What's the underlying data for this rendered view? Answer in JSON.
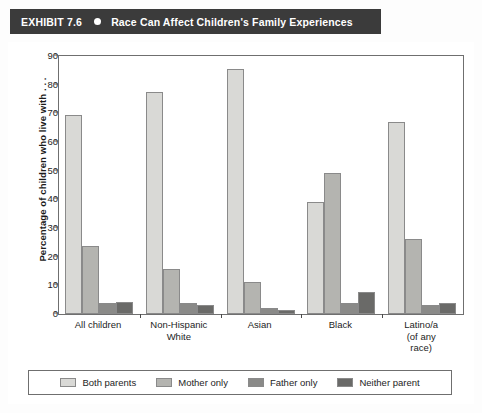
{
  "header": {
    "exhibit_label": "EXHIBIT 7.6",
    "bullet_icon": "bullet-dot",
    "title": "Race Can Affect Children's Family Experiences",
    "background_color": "#3b3b3b",
    "text_color": "#ffffff"
  },
  "chart_data": {
    "type": "bar",
    "title": "Race Can Affect Children's Family Experiences",
    "xlabel": "",
    "ylabel": "Percentage of children who live with . . .",
    "ylim": [
      0,
      90
    ],
    "yticks": [
      0,
      10,
      20,
      30,
      40,
      50,
      60,
      70,
      80,
      90
    ],
    "grid": false,
    "legend_position": "bottom",
    "categories": [
      "All children",
      "Non-Hispanic White",
      "Asian",
      "Black",
      "Latino/a (of any race)"
    ],
    "category_lines": [
      [
        "All children"
      ],
      [
        "Non-Hispanic",
        "White"
      ],
      [
        "Asian"
      ],
      [
        "Black"
      ],
      [
        "Latino/a",
        "(of any",
        "race)"
      ]
    ],
    "series": [
      {
        "name": "Both parents",
        "color": "#d9d9d6",
        "values": [
          69.3,
          77.5,
          85.5,
          39.0,
          67.0
        ]
      },
      {
        "name": "Mother only",
        "color": "#b4b4b0",
        "values": [
          23.8,
          15.8,
          11.0,
          49.3,
          26.2
        ]
      },
      {
        "name": "Father only",
        "color": "#8a8a88",
        "values": [
          4.0,
          4.0,
          2.0,
          4.0,
          3.2
        ]
      },
      {
        "name": "Neither parent",
        "color": "#6a6a68",
        "values": [
          4.2,
          3.0,
          1.5,
          7.8,
          4.0
        ]
      }
    ]
  },
  "legend": {
    "items": [
      {
        "label": "Both parents",
        "color": "#d9d9d6"
      },
      {
        "label": "Mother only",
        "color": "#b4b4b0"
      },
      {
        "label": "Father only",
        "color": "#8a8a88"
      },
      {
        "label": "Neither parent",
        "color": "#6a6a68"
      }
    ]
  }
}
